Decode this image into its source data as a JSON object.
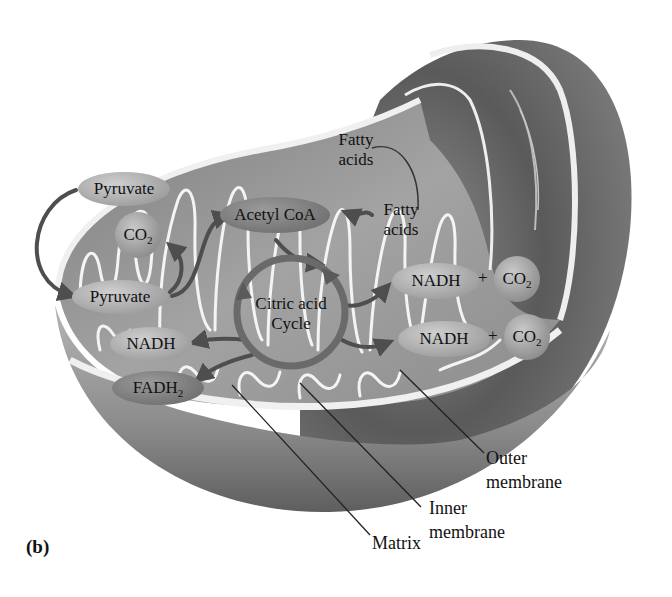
{
  "figure": {
    "panel_label": "(b)",
    "colors": {
      "outer_shell": "#6b6b6b",
      "matrix": "#9a9a9a",
      "membrane_highlight": "#f2f2f2",
      "arrow": "#555555",
      "text": "#111111"
    }
  },
  "molecules": {
    "pyruvate_top": "Pyruvate",
    "co2_left": "CO",
    "co2_left_sub": "2",
    "pyruvate_inner": "Pyruvate",
    "acetyl_coa": "Acetyl CoA",
    "fatty_acids_outer": [
      "Fatty",
      "acids"
    ],
    "fatty_acids_inner": [
      "Fatty",
      "acids"
    ],
    "citric_acid_cycle": [
      "Citric acid",
      "Cycle"
    ],
    "nadh_left": "NADH",
    "fadh2": "FADH",
    "fadh2_sub": "2",
    "nadh_right_1": "NADH",
    "co2_right_1": "CO",
    "co2_right_1_sub": "2",
    "nadh_right_2": "NADH",
    "co2_right_2": "CO",
    "co2_right_2_sub": "2",
    "plus": "+"
  },
  "callouts": {
    "outer_membrane": [
      "Outer",
      "membrane"
    ],
    "inner_membrane": [
      "Inner",
      "membrane"
    ],
    "matrix": "Matrix"
  }
}
